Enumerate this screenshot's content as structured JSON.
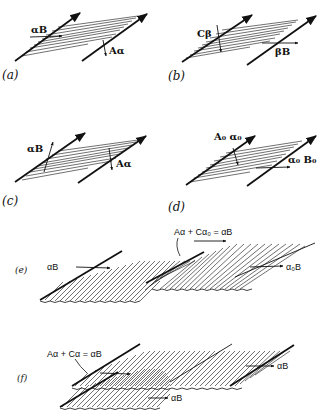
{
  "panels": {
    "a": {
      "caption": "(a)",
      "labels": {
        "incident": "αB",
        "reflected": "Aα"
      }
    },
    "b": {
      "caption": "(b)",
      "labels": {
        "incident": "Cβ",
        "transmitted": "βB"
      }
    },
    "c": {
      "caption": "(c)",
      "labels": {
        "incident": "αB",
        "reflected": "Aα"
      }
    },
    "d": {
      "caption": "(d)",
      "labels": {
        "left": "A₀  α₀",
        "right": "α₀  B₀"
      }
    },
    "e": {
      "caption": "(e)",
      "labels": {
        "equation": "Aα + Cα₀ = αB",
        "left": "αB",
        "right": "α₀B"
      }
    },
    "f": {
      "caption": "(f)",
      "labels": {
        "equation": "Aα + Cα = αB",
        "right": "αB",
        "bottom": "αB"
      }
    }
  },
  "colors": {
    "ink": "#111111",
    "background": "#ffffff"
  }
}
